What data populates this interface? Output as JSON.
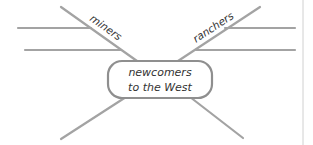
{
  "diagram": {
    "type": "web-organizer",
    "center": {
      "line1": "newcomers",
      "line2": "to the West"
    },
    "branches": [
      {
        "label": "miners",
        "position": "upper-left",
        "details": [
          "",
          ""
        ]
      },
      {
        "label": "ranchers",
        "position": "upper-right",
        "details": [
          "",
          ""
        ]
      },
      {
        "label": "",
        "position": "lower-left",
        "details": []
      },
      {
        "label": "",
        "position": "lower-right",
        "details": []
      }
    ],
    "colors": {
      "line": "#a3a3a3",
      "box_border": "#8f8f8f",
      "text": "#333333",
      "background": "#ffffff"
    }
  }
}
